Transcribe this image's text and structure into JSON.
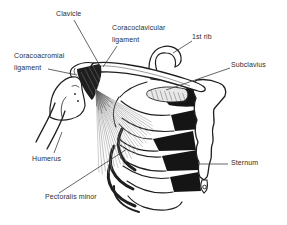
{
  "figure": {
    "type": "anatomical line drawing"
  },
  "labels": {
    "clavicle": "Clavicle",
    "coracoclavicular_ligament": "Coracoclavicular\nligament",
    "first_rib": "1st rib",
    "coracoacromial_ligament": "Coracoacromial\nligament",
    "subclavius": "Subclavius",
    "humerus": "Humerus",
    "sternum": "Sternum",
    "pectoralis_minor": "Pectoralis minor"
  },
  "colors": {
    "background": "#ffffff",
    "line": "#1f1f1f",
    "text": "#2e2e2e",
    "intercostal_fill": "#151515",
    "ligament_dark": "#1e1e1e",
    "muscle_hatch": "#949494",
    "leader": "#3f3f3f"
  }
}
